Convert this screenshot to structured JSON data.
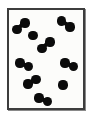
{
  "figure": {
    "title": "",
    "kind": "particle-diagram",
    "background_color": "#ffffff",
    "panel_color": "#fcfcfa",
    "border_color": "#3d3d3d",
    "border_highlight_color": "#8a8a8a",
    "particle_color": "#0b0b0b",
    "border_width_px": 2
  },
  "container": {
    "x": 7,
    "y": 8,
    "width": 78,
    "height": 102
  },
  "chart_data": {
    "type": "scatter",
    "title": "",
    "xlabel": "",
    "ylabel": "",
    "xlim": [
      0,
      91
    ],
    "ylim": [
      0,
      118
    ],
    "grid": false,
    "legend": false,
    "units": "pixels",
    "dot_radius": 4.6,
    "bond_width": 4.2,
    "counts": {
      "molecules": 7,
      "single_atoms": 2,
      "total_atoms": 16
    },
    "series": [
      {
        "name": "diatomic-molecules",
        "items": [
          {
            "id": "m1",
            "a": [
              17.0,
              29.5
            ],
            "b": [
              25.0,
              23.0
            ]
          },
          {
            "id": "m2",
            "a": [
              61.5,
              21.0
            ],
            "b": [
              70.0,
              27.0
            ]
          },
          {
            "id": "m3",
            "a": [
              42.0,
              48.5
            ],
            "b": [
              50.0,
              42.0
            ]
          },
          {
            "id": "m4",
            "a": [
              20.0,
              63.0
            ],
            "b": [
              28.5,
              66.5
            ]
          },
          {
            "id": "m5",
            "a": [
              65.0,
              63.0
            ],
            "b": [
              73.5,
              66.5
            ]
          },
          {
            "id": "m6",
            "a": [
              28.0,
              84.0
            ],
            "b": [
              36.0,
              79.5
            ]
          },
          {
            "id": "m7",
            "a": [
              39.0,
              98.0
            ],
            "b": [
              47.5,
              101.5
            ]
          }
        ]
      },
      {
        "name": "single-atoms",
        "items": [
          {
            "id": "s1",
            "a": [
              33.0,
              35.5
            ]
          },
          {
            "id": "s2",
            "a": [
              63.0,
              85.0
            ]
          }
        ]
      }
    ]
  }
}
